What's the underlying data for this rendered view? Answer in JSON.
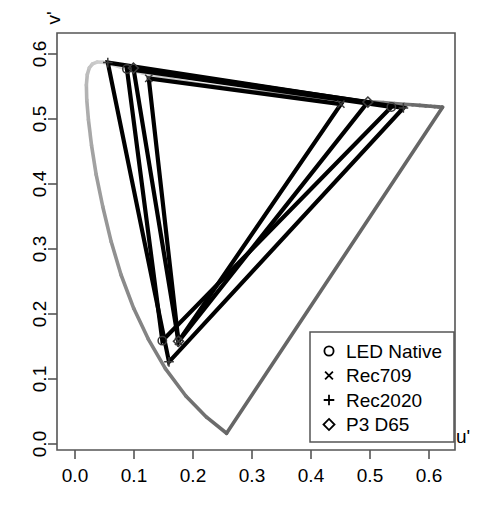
{
  "chart_data": {
    "type": "line",
    "title": "",
    "xlabel": "u'",
    "ylabel": "v'",
    "xlim": [
      -0.02,
      0.65
    ],
    "ylim": [
      -0.02,
      0.63
    ],
    "xticks": [
      "0.0",
      "0.1",
      "0.2",
      "0.3",
      "0.4",
      "0.5",
      "0.6"
    ],
    "xtick_values": [
      0.0,
      0.1,
      0.2,
      0.3,
      0.4,
      0.5,
      0.6
    ],
    "yticks": [
      "0.0",
      "0.1",
      "0.2",
      "0.3",
      "0.4",
      "0.5",
      "0.6"
    ],
    "ytick_values": [
      0.0,
      0.1,
      0.2,
      0.3,
      0.4,
      0.5,
      0.6
    ],
    "grid": false,
    "legend_position": "bottom-right",
    "series": [
      {
        "name": "LED Native",
        "marker": "circle",
        "color": "#000000",
        "points": [
          {
            "label": "red",
            "u": 0.5362,
            "v": 0.5185
          },
          {
            "label": "green",
            "u": 0.088,
            "v": 0.577
          },
          {
            "label": "blue",
            "u": 0.148,
            "v": 0.159
          }
        ]
      },
      {
        "name": "Rec709",
        "marker": "cross",
        "color": "#000000",
        "points": [
          {
            "label": "red",
            "u": 0.4507,
            "v": 0.5229
          },
          {
            "label": "green",
            "u": 0.125,
            "v": 0.5625
          },
          {
            "label": "blue",
            "u": 0.1754,
            "v": 0.1579
          }
        ]
      },
      {
        "name": "Rec2020",
        "marker": "plus",
        "color": "#000000",
        "points": [
          {
            "label": "red",
            "u": 0.5566,
            "v": 0.517
          },
          {
            "label": "green",
            "u": 0.0556,
            "v": 0.5868
          },
          {
            "label": "blue",
            "u": 0.1593,
            "v": 0.1264
          }
        ]
      },
      {
        "name": "P3 D65",
        "marker": "diamond",
        "color": "#000000",
        "points": [
          {
            "label": "red",
            "u": 0.4964,
            "v": 0.526
          },
          {
            "label": "green",
            "u": 0.099,
            "v": 0.5783
          },
          {
            "label": "blue",
            "u": 0.1754,
            "v": 0.1579
          }
        ]
      }
    ],
    "spectral_locus": {
      "name": "spectral-locus",
      "description": "CIE 1976 u'v' spectral locus, gray gradient light-to-dark",
      "stroke_light": "#d9d9d9",
      "stroke_dark": "#666666",
      "points": [
        [
          0.2569,
          0.0165
        ],
        [
          0.223,
          0.0412
        ],
        [
          0.1879,
          0.0739
        ],
        [
          0.1532,
          0.1159
        ],
        [
          0.1242,
          0.1614
        ],
        [
          0.0995,
          0.2088
        ],
        [
          0.078,
          0.2604
        ],
        [
          0.0614,
          0.311
        ],
        [
          0.047,
          0.3654
        ],
        [
          0.0358,
          0.4148
        ],
        [
          0.028,
          0.4597
        ],
        [
          0.0228,
          0.4987
        ],
        [
          0.0199,
          0.5297
        ],
        [
          0.0193,
          0.5524
        ],
        [
          0.0208,
          0.5683
        ],
        [
          0.0243,
          0.5787
        ],
        [
          0.0297,
          0.5849
        ],
        [
          0.0374,
          0.5876
        ],
        [
          0.0473,
          0.5872
        ],
        [
          0.0601,
          0.5846
        ],
        [
          0.0757,
          0.5804
        ],
        [
          0.0938,
          0.5757
        ],
        [
          0.1145,
          0.5708
        ],
        [
          0.1376,
          0.5659
        ],
        [
          0.1625,
          0.5613
        ],
        [
          0.1893,
          0.5569
        ],
        [
          0.2173,
          0.5528
        ],
        [
          0.2465,
          0.549
        ],
        [
          0.2764,
          0.5455
        ],
        [
          0.3068,
          0.5423
        ],
        [
          0.3372,
          0.5393
        ],
        [
          0.3673,
          0.5366
        ],
        [
          0.3967,
          0.5342
        ],
        [
          0.4252,
          0.532
        ],
        [
          0.4523,
          0.53
        ],
        [
          0.4776,
          0.5282
        ],
        [
          0.501,
          0.5266
        ],
        [
          0.5223,
          0.5252
        ],
        [
          0.5412,
          0.5239
        ],
        [
          0.5578,
          0.5228
        ],
        [
          0.5721,
          0.5218
        ],
        [
          0.5843,
          0.5209
        ],
        [
          0.5945,
          0.5202
        ],
        [
          0.6029,
          0.5196
        ],
        [
          0.6098,
          0.5191
        ],
        [
          0.6161,
          0.5186
        ],
        [
          0.6215,
          0.5182
        ],
        [
          0.623,
          0.5181
        ]
      ]
    },
    "purple_line": {
      "name": "line-of-purples",
      "stroke": "#666666",
      "from": [
        0.623,
        0.5181
      ],
      "to": [
        0.2569,
        0.0165
      ]
    }
  },
  "legend": {
    "entries": [
      {
        "label": "LED Native",
        "marker": "circle"
      },
      {
        "label": "Rec709",
        "marker": "cross"
      },
      {
        "label": "Rec2020",
        "marker": "plus"
      },
      {
        "label": "P3 D65",
        "marker": "diamond"
      }
    ]
  },
  "axes": {
    "x_title": "u'",
    "y_title": "v'"
  }
}
